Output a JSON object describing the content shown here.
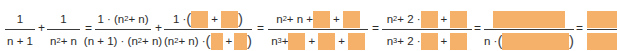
{
  "colors": {
    "blank_fill": "#f5b06a",
    "text": "#2b2b2b",
    "fraction_bar": "#3a3a3a"
  },
  "expression": {
    "frac1": {
      "num": "1",
      "den": "n + 1"
    },
    "op1": "+",
    "frac2": {
      "num": "1",
      "den_base": "n",
      "den_exp": "2",
      "den_rest": " + n"
    },
    "eq1": "=",
    "frac3": {
      "num_a": "1 · (n",
      "num_exp": "2",
      "num_b": " + n)",
      "den_a": "(n + 1) · (n",
      "den_exp": "2",
      "den_b": " + n)"
    },
    "op2": "+",
    "frac4": {
      "num_a": "1 · ",
      "open": "(",
      "plus": "+",
      "close": ")",
      "den_a": "(n",
      "den_exp": "2",
      "den_b": " + n) · "
    },
    "eq2": "=",
    "frac5": {
      "num_a": "n",
      "num_exp": "2",
      "num_b": " + n + ",
      "plus": "+",
      "den_a": "n",
      "den_exp": "3",
      "den_b": " + "
    },
    "eq3": "=",
    "frac6": {
      "num_a": "n",
      "num_exp": "2",
      "num_b": " + 2 · ",
      "plus": "+",
      "den_a": "n",
      "den_exp": "3",
      "den_b": " + 2 · "
    },
    "eq4": "=",
    "frac7": {
      "den_a": "n · ",
      "open": "(",
      "close": ")"
    },
    "eq5": "="
  }
}
